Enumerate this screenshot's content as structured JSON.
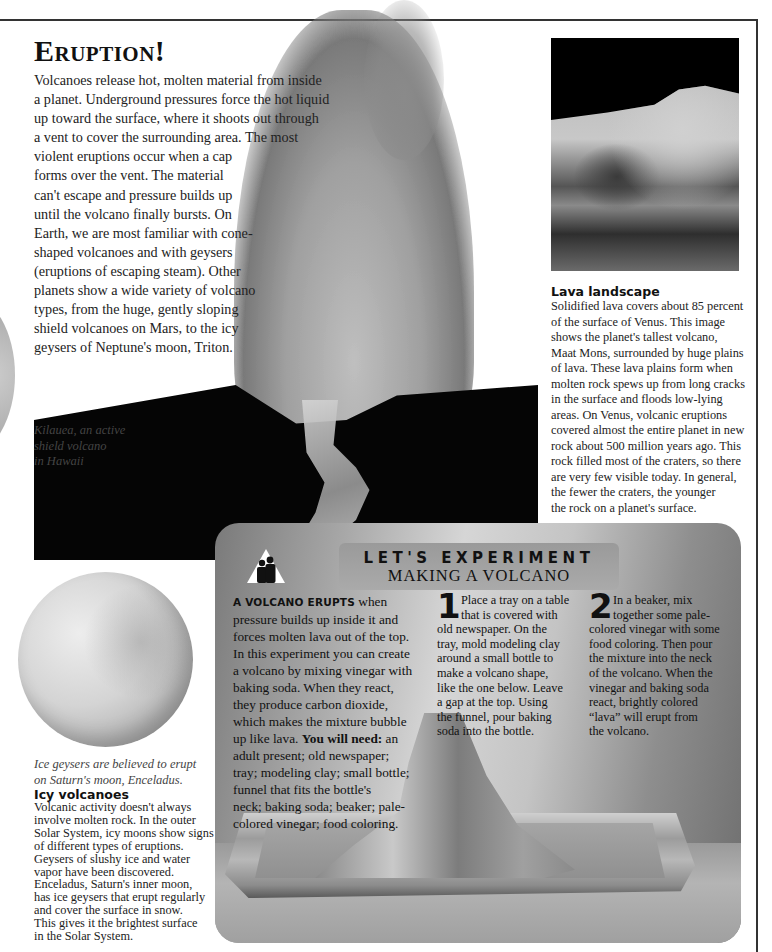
{
  "page": {
    "title": "Eruption!",
    "intro_lines": [
      "Volcanoes release hot, molten material from inside",
      "a planet. Underground pressures force the hot liquid",
      "up toward the surface, where it shoots out through",
      "a vent to cover the surrounding area. The most",
      "violent eruptions occur when a cap",
      "forms over the vent. The material",
      "can't escape and pressure builds up",
      "until the volcano finally bursts. On",
      "Earth, we are most familiar with cone-",
      "shaped volcanoes and with geysers",
      "(eruptions of escaping steam). Other",
      "planets show a wide variety of volcano",
      "types, from the huge, gently sloping",
      "shield volcanoes on Mars, to the icy",
      "geysers of Neptune's moon, Triton."
    ],
    "kilauea_caption_lines": [
      "Kilauea, an active",
      "shield volcano",
      "in Hawaii"
    ]
  },
  "venus": {
    "title": "Lava landscape",
    "body_lines": [
      "Solidified lava covers about 85 percent",
      "of the surface of Venus. This image",
      "shows the planet's tallest volcano,",
      "Maat Mons, surrounded by huge plains",
      "of lava. These lava plains form when",
      "molten rock spews up from long cracks",
      "in the surface and floods low-lying",
      "areas. On Venus, volcanic eruptions",
      "covered almost the entire planet in new",
      "rock about 500 million years ago. This",
      "rock filled most of the craters, so there",
      "are very few visible today. In general,",
      "the fewer the craters, the younger",
      "the rock on a planet's surface."
    ]
  },
  "experiment": {
    "banner_title": "LET'S EXPERIMENT",
    "banner_subtitle": "MAKING A VOLCANO",
    "icon": "adult-supervision-icon",
    "intro_lead": "A VOLCANO ERUPTS",
    "intro_lines": [
      " when",
      "pressure builds up inside it and",
      "forces molten lava out of the top.",
      "In this experiment you can create",
      "a volcano by mixing vinegar with",
      "baking soda. When they react,",
      "they produce carbon dioxide,",
      "which makes the mixture bubble",
      "up like lava. "
    ],
    "need_label": "You will need:",
    "need_lines": [
      " an",
      "adult present; old newspaper;",
      "tray; modeling clay; small bottle;",
      "funnel that fits the bottle's",
      "neck; baking soda; beaker; pale-",
      "colored vinegar; food coloring."
    ],
    "steps": [
      {
        "number": "1",
        "lines": [
          "Place a tray on a table",
          "that is covered with",
          "old newspaper. On the",
          "tray, mold modeling clay",
          "around a small bottle to",
          "make a volcano shape,",
          "like the one below. Leave",
          "a gap at the top. Using",
          "the funnel, pour baking",
          "soda into the bottle."
        ]
      },
      {
        "number": "2",
        "lines": [
          "In a beaker, mix",
          "together some pale-",
          "colored vinegar with some",
          "food coloring. Then pour",
          "the mixture into the neck",
          "of the volcano. When the",
          "vinegar and baking soda",
          "react, brightly colored",
          "“lava” will erupt from",
          "the volcano."
        ]
      }
    ]
  },
  "enceladus": {
    "caption_lines": [
      "Ice geysers are believed to erupt",
      "on Saturn's moon, Enceladus."
    ],
    "title": "Icy volcanoes",
    "body_lines": [
      "Volcanic activity doesn't always",
      "involve molten rock. In the outer",
      "Solar System, icy moons show signs",
      "of different types of eruptions.",
      "Geysers of slushy ice and water",
      "vapor have been discovered.",
      "Enceladus, Saturn's inner moon,",
      "has ice geysers that erupt regularly",
      "and cover the surface in snow.",
      "This gives it the brightest surface",
      "in the Solar System."
    ]
  }
}
